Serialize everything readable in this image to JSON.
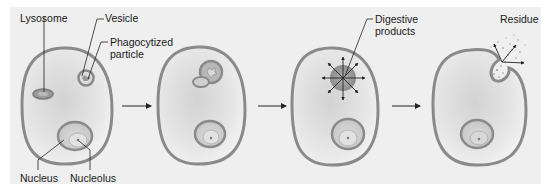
{
  "colors": {
    "background": "#efefef",
    "membrane": "#8a8a8a",
    "cytoplasm_center": "#d6d6d6",
    "cytoplasm_edge": "#f4f4f4",
    "organelle": "#a8a8a8",
    "arrow": "#222222"
  },
  "stages": [
    {
      "step": 1,
      "labels": [
        "Lysosome",
        "Vesicle",
        "Phagocytized particle",
        "Nucleus",
        "Nucleolus"
      ]
    },
    {
      "step": 2,
      "labels": []
    },
    {
      "step": 3,
      "labels": [
        "Digestive products"
      ]
    },
    {
      "step": 4,
      "labels": [
        "Residue"
      ]
    }
  ],
  "labels": {
    "lysosome": "Lysosome",
    "vesicle": "Vesicle",
    "phagocytized_1": "Phagocytized",
    "phagocytized_2": "particle",
    "nucleus": "Nucleus",
    "nucleolus": "Nucleolus",
    "digestive_1": "Digestive",
    "digestive_2": "products",
    "residue": "Residue"
  },
  "flow_arrows": 3
}
